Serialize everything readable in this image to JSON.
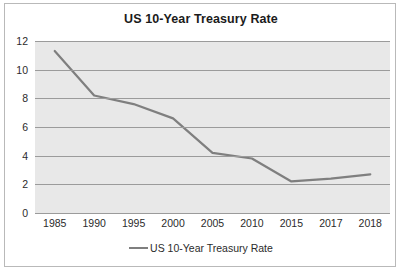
{
  "chart_data": {
    "type": "line",
    "title": "US 10-Year Treasury Rate",
    "xlabel": "",
    "ylabel": "",
    "categories": [
      "1985",
      "1990",
      "1995",
      "2000",
      "2005",
      "2010",
      "2015",
      "2017",
      "2018"
    ],
    "series": [
      {
        "name": "US 10-Year Treasury Rate",
        "values": [
          11.3,
          8.2,
          7.6,
          6.6,
          4.2,
          3.8,
          2.2,
          2.4,
          2.7
        ],
        "color": "#7f7f7f"
      }
    ],
    "ylim": [
      0,
      12
    ],
    "yticks": [
      0,
      2,
      4,
      6,
      8,
      10,
      12
    ],
    "grid": true,
    "legend": {
      "position": "bottom",
      "entries": [
        "US 10-Year Treasury Rate"
      ],
      "marker": "line-swatch"
    },
    "plot_background": "#e8e8e8",
    "gridline_color": "#9b9b9b",
    "border_color": "#b9b9b9"
  }
}
